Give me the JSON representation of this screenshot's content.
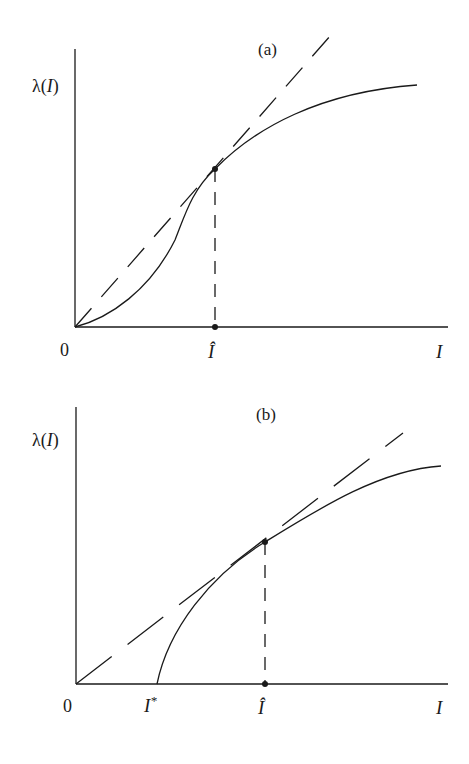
{
  "panels": [
    {
      "id": "a",
      "title": "(a)",
      "y_label": "λ(I)",
      "x_label": "I",
      "origin_label": "0",
      "tick_labels": [
        "Î"
      ],
      "curve": "S-shaped (convex then concave) λ(I) starting at origin",
      "tangent": "dashed ray from origin tangent to curve at Î"
    },
    {
      "id": "b",
      "title": "(b)",
      "y_label": "λ(I)",
      "x_label": "I",
      "origin_label": "0",
      "tick_labels": [
        "I*",
        "Î"
      ],
      "curve": "concave λ(I) starting at I* on the horizontal axis",
      "tangent": "dashed ray from origin tangent to curve at Î"
    }
  ],
  "labels": {
    "a_title": "(a)",
    "a_ylabel_lambda": "λ(",
    "a_ylabel_I": "I",
    "a_ylabel_close": ")",
    "a_origin": "0",
    "a_ihat": "Î",
    "a_xlabel": "I",
    "b_title": "(b)",
    "b_ylabel_lambda": "λ(",
    "b_ylabel_I": "I",
    "b_ylabel_close": ")",
    "b_origin": "0",
    "b_istar": "I",
    "b_istar_sup": "*",
    "b_ihat": "Î",
    "b_xlabel": "I"
  },
  "colors": {
    "ink": "#1a1a1a",
    "background": "#ffffff"
  }
}
